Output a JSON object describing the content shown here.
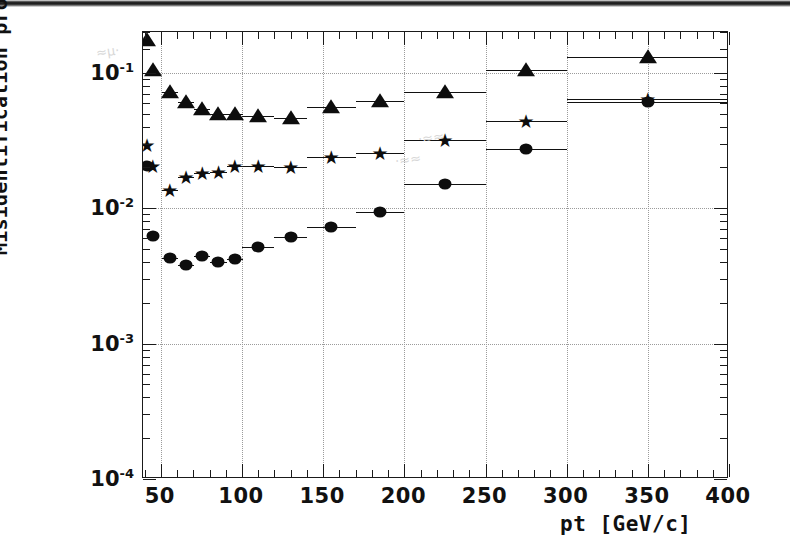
{
  "chart_data": {
    "type": "scatter",
    "title": "",
    "xlabel": "pt [GeV/c]",
    "ylabel": "Misidentification probability",
    "xlim": [
      39,
      400
    ],
    "ylim": [
      0.0001,
      0.2
    ],
    "yscale": "log",
    "xscale": "linear",
    "grid": true,
    "legend_position": "none",
    "xticks": [
      50,
      100,
      150,
      200,
      250,
      300,
      350,
      400
    ],
    "xtick_labels": [
      "50",
      "100",
      "150",
      "200",
      "250",
      "300",
      "350",
      "400"
    ],
    "yticks": [
      0.1,
      0.01,
      0.001,
      0.0001
    ],
    "ytick_labels": [
      "10-1",
      "10-2",
      "10-3",
      "10-4"
    ],
    "series": [
      {
        "name": "triangle-series",
        "marker": "triangle",
        "points": [
          {
            "x": 41.5,
            "y": 0.175,
            "xerr": 2.5
          },
          {
            "x": 45.0,
            "y": 0.105,
            "xerr": 2.5
          },
          {
            "x": 55.5,
            "y": 0.072,
            "xerr": 5.0
          },
          {
            "x": 65.5,
            "y": 0.061,
            "xerr": 5.0
          },
          {
            "x": 75.5,
            "y": 0.054,
            "xerr": 5.0
          },
          {
            "x": 85.5,
            "y": 0.05,
            "xerr": 5.0
          },
          {
            "x": 95.5,
            "y": 0.05,
            "xerr": 5.0
          },
          {
            "x": 110.0,
            "y": 0.048,
            "xerr": 10.0
          },
          {
            "x": 130.0,
            "y": 0.046,
            "xerr": 10.0
          },
          {
            "x": 155.0,
            "y": 0.056,
            "xerr": 15.0
          },
          {
            "x": 185.0,
            "y": 0.062,
            "xerr": 15.0
          },
          {
            "x": 225.0,
            "y": 0.072,
            "xerr": 25.0
          },
          {
            "x": 275.0,
            "y": 0.105,
            "xerr": 25.0
          },
          {
            "x": 350.0,
            "y": 0.13,
            "xerr": 50.0
          }
        ]
      },
      {
        "name": "star-series",
        "marker": "star",
        "points": [
          {
            "x": 41.5,
            "y": 0.0295,
            "xerr": 2.5
          },
          {
            "x": 45.0,
            "y": 0.0205,
            "xerr": 2.5
          },
          {
            "x": 55.5,
            "y": 0.0136,
            "xerr": 5.0
          },
          {
            "x": 65.5,
            "y": 0.017,
            "xerr": 5.0
          },
          {
            "x": 75.5,
            "y": 0.0182,
            "xerr": 5.0
          },
          {
            "x": 85.5,
            "y": 0.0186,
            "xerr": 5.0
          },
          {
            "x": 95.5,
            "y": 0.0205,
            "xerr": 5.0
          },
          {
            "x": 110.0,
            "y": 0.0205,
            "xerr": 10.0
          },
          {
            "x": 130.0,
            "y": 0.02,
            "xerr": 10.0
          },
          {
            "x": 155.0,
            "y": 0.024,
            "xerr": 15.0
          },
          {
            "x": 185.0,
            "y": 0.0257,
            "xerr": 15.0
          },
          {
            "x": 225.0,
            "y": 0.032,
            "xerr": 25.0
          },
          {
            "x": 275.0,
            "y": 0.044,
            "xerr": 25.0
          },
          {
            "x": 350.0,
            "y": 0.0645,
            "xerr": 50.0
          }
        ]
      },
      {
        "name": "circle-series",
        "marker": "circle",
        "points": [
          {
            "x": 41.5,
            "y": 0.0205,
            "xerr": 2.5
          },
          {
            "x": 45.0,
            "y": 0.0062,
            "xerr": 2.5
          },
          {
            "x": 55.5,
            "y": 0.0043,
            "xerr": 5.0
          },
          {
            "x": 65.5,
            "y": 0.0038,
            "xerr": 5.0
          },
          {
            "x": 75.5,
            "y": 0.0044,
            "xerr": 5.0
          },
          {
            "x": 85.5,
            "y": 0.004,
            "xerr": 5.0
          },
          {
            "x": 95.5,
            "y": 0.0042,
            "xerr": 5.0
          },
          {
            "x": 110.0,
            "y": 0.0052,
            "xerr": 10.0
          },
          {
            "x": 130.0,
            "y": 0.0061,
            "xerr": 10.0
          },
          {
            "x": 155.0,
            "y": 0.0072,
            "xerr": 15.0
          },
          {
            "x": 185.0,
            "y": 0.0093,
            "xerr": 15.0
          },
          {
            "x": 225.0,
            "y": 0.0152,
            "xerr": 25.0
          },
          {
            "x": 275.0,
            "y": 0.0272,
            "xerr": 25.0
          },
          {
            "x": 350.0,
            "y": 0.061,
            "xerr": 50.0
          }
        ]
      }
    ]
  },
  "artifacts": {
    "smudge_a": "",
    "smudge_b": ""
  }
}
